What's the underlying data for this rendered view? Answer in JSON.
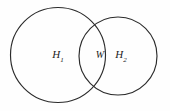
{
  "figure": {
    "kind": "venn-diagram",
    "background_color": "#fefefe",
    "stroke_color": "#2b2b2b",
    "label_color": "#222222",
    "width": 170,
    "height": 111
  },
  "shapes": {
    "left_circle": {
      "name": "left-set-circle",
      "cx": 58,
      "cy": 55,
      "r": 47.5
    },
    "right_circle": {
      "name": "right-set-circle",
      "cx": 118,
      "cy": 56,
      "r": 39
    }
  },
  "labels": {
    "left": {
      "base": "H",
      "sub": "1",
      "x": 58,
      "y": 55
    },
    "intersection": {
      "base": "W",
      "sub": "",
      "x": 100,
      "y": 55
    },
    "right": {
      "base": "H",
      "sub": "2",
      "x": 121,
      "y": 55
    }
  }
}
